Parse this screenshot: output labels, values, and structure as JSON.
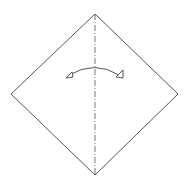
{
  "diagram": {
    "type": "origami-step",
    "paper": {
      "shape": "diamond",
      "vertices": {
        "top": [
          95,
          14
        ],
        "right": [
          178,
          94
        ],
        "bottom": [
          95,
          175
        ],
        "left": [
          11,
          94
        ]
      },
      "stroke_color": "#555555",
      "fill_color": "#ffffff"
    },
    "fold_line": {
      "kind": "valley-fold",
      "style": "dash-dot",
      "orientation": "vertical",
      "from": [
        95,
        14
      ],
      "to": [
        95,
        175
      ],
      "stroke_color": "#666666"
    },
    "arrow": {
      "kind": "fold-and-unfold",
      "from": [
        67,
        77
      ],
      "to": [
        121,
        77
      ],
      "arc_peak": [
        95,
        67
      ],
      "arrowheads": "hollow-triangle-both-ends",
      "stroke_color": "#555555"
    }
  }
}
